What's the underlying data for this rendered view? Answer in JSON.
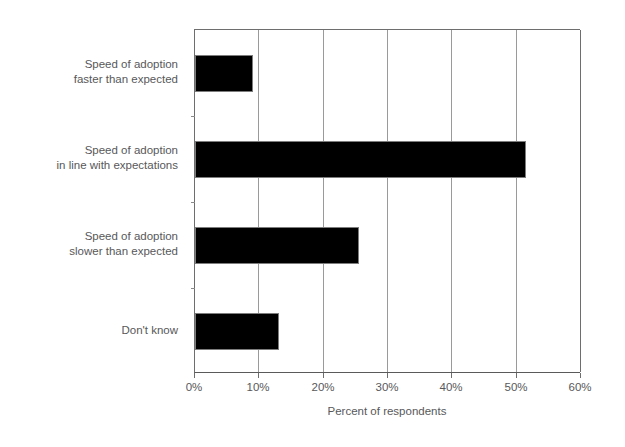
{
  "chart_data": {
    "type": "bar",
    "orientation": "horizontal",
    "title": "",
    "subtitle": "",
    "xlabel": "Percent of respondents",
    "ylabel": "",
    "categories": [
      "Speed of adoption\nfaster than expected",
      "Speed of adoption\nin line with expectations",
      "Speed of adoption\nslower than expected",
      "Don't know"
    ],
    "values": [
      9,
      51.5,
      25.5,
      13
    ],
    "xlim": [
      0,
      60
    ],
    "xticks": [
      0,
      10,
      20,
      30,
      40,
      50,
      60
    ],
    "xtick_labels": [
      "0%",
      "10%",
      "20%",
      "30%",
      "40%",
      "50%",
      "60%"
    ],
    "grid": "vertical",
    "legend": "none",
    "bar_color": "#000000",
    "bar_edge_color": "#7d7d7d",
    "gridline_color": "#9a9a9a",
    "axis_color": "#6e6e6e",
    "text_color": "#58585a",
    "background": "#ffffff"
  },
  "axis": {
    "x_title": "Percent of respondents"
  }
}
